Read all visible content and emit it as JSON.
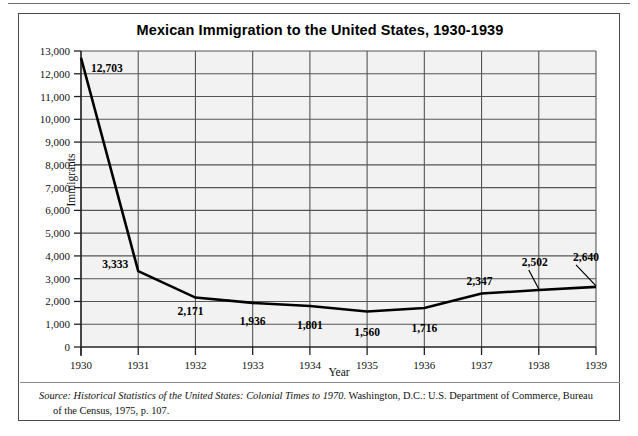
{
  "figure": {
    "title": "Mexican Immigration to the United States, 1930-1939",
    "source_prefix": "Source:",
    "source_italic": "Historical Statistics of the United States: Colonial Times to 1970.",
    "source_rest": " Washington, D.C.: U.S. Department of Commerce, Bureau",
    "source_line2": "of the Census, 1975, p. 107."
  },
  "chart_data": {
    "type": "line",
    "title": "Mexican Immigration to the United States, 1930-1939",
    "xlabel": "Year",
    "ylabel": "Immigrants",
    "categories": [
      "1930",
      "1931",
      "1932",
      "1933",
      "1934",
      "1935",
      "1936",
      "1937",
      "1938",
      "1939"
    ],
    "values": [
      12703,
      3333,
      2171,
      1936,
      1801,
      1560,
      1716,
      2347,
      2502,
      2640
    ],
    "point_labels": [
      "12,703",
      "3,333",
      "2,171",
      "1,936",
      "1,801",
      "1,560",
      "1,716",
      "2,347",
      "2,502",
      "2,640"
    ],
    "ylim": [
      0,
      13000
    ],
    "ytick_values": [
      0,
      1000,
      2000,
      3000,
      4000,
      5000,
      6000,
      7000,
      8000,
      9000,
      10000,
      11000,
      12000,
      13000
    ],
    "ytick_labels": [
      "0",
      "1,000",
      "2,000",
      "3,000",
      "4,000",
      "5,000",
      "6,000",
      "7,000",
      "8,000",
      "9,000",
      "10,000",
      "11,000",
      "12,000",
      "13,000"
    ],
    "grid": "both",
    "legend": "none",
    "line_color": "#000000",
    "plot_background": "#f2f2f2",
    "grid_color": "#555555"
  }
}
